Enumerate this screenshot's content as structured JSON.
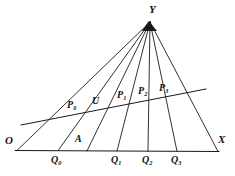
{
  "figure": {
    "kind": "geometry-diagram",
    "background_color": "#ffffff",
    "line_color": "#1a1a1a"
  },
  "labels": {
    "apex": {
      "text": "Y",
      "x": 149,
      "y": 4
    },
    "origin": {
      "text": "O",
      "x": 5,
      "y": 135
    },
    "x_axis": {
      "text": "X",
      "x": 218,
      "y": 134
    },
    "a_point": {
      "text": "A",
      "x": 75,
      "y": 134
    },
    "base_points": [
      {
        "text": "Q",
        "sub": "0",
        "x": 51,
        "y": 155
      },
      {
        "text": "Q",
        "sub": "1",
        "x": 111,
        "y": 155
      },
      {
        "text": "Q",
        "sub": "2",
        "x": 142,
        "y": 155
      },
      {
        "text": "Q",
        "sub": "3",
        "x": 171,
        "y": 155
      }
    ],
    "transversal_points": [
      {
        "text": "P",
        "sub": "0",
        "x": 67,
        "y": 100
      },
      {
        "text": "U",
        "sub": "",
        "x": 92,
        "y": 96
      },
      {
        "text": "P",
        "sub": "1",
        "x": 117,
        "y": 90
      },
      {
        "text": "P",
        "sub": "2",
        "x": 138,
        "y": 86
      },
      {
        "text": "P",
        "sub": "3",
        "x": 159,
        "y": 83
      }
    ]
  },
  "chart_data": {
    "type": "scatter",
    "title": "",
    "xlabel": "",
    "ylabel": "",
    "apex": {
      "name": "Y",
      "x": 150,
      "y": 22
    },
    "base_line": {
      "name": "OX",
      "from": {
        "x": 15,
        "y": 150.5
      },
      "to": {
        "x": 219,
        "y": 151.5
      }
    },
    "transversal_line": {
      "from": {
        "x": 21,
        "y": 125
      },
      "to": {
        "x": 206,
        "y": 89
      }
    },
    "rays": [
      {
        "name": "YO",
        "to_x": 17,
        "to_y": 150.5
      },
      {
        "name": "YQ0",
        "to_x": 58,
        "to_y": 150.7
      },
      {
        "name": "YA",
        "to_x": 87,
        "to_y": 150.9
      },
      {
        "name": "YQ1",
        "to_x": 117,
        "to_y": 151.0
      },
      {
        "name": "YQ2",
        "to_x": 148,
        "to_y": 151.2
      },
      {
        "name": "YQ3",
        "to_x": 177,
        "to_y": 151.3
      },
      {
        "name": "YX",
        "to_x": 218,
        "to_y": 151.5
      }
    ],
    "base_markers": [
      {
        "name": "O",
        "x": 17
      },
      {
        "name": "Q0",
        "x": 58
      },
      {
        "name": "A",
        "x": 87
      },
      {
        "name": "Q1",
        "x": 117
      },
      {
        "name": "Q2",
        "x": 148
      },
      {
        "name": "Q3",
        "x": 177
      },
      {
        "name": "X",
        "x": 218
      }
    ],
    "transversal_markers": [
      {
        "name": "P0",
        "on_ray": "YQ0"
      },
      {
        "name": "U",
        "on_ray": "YA"
      },
      {
        "name": "P1",
        "on_ray": "YQ1"
      },
      {
        "name": "P2",
        "on_ray": "YQ2"
      },
      {
        "name": "P3",
        "on_ray": "YQ3"
      }
    ]
  }
}
